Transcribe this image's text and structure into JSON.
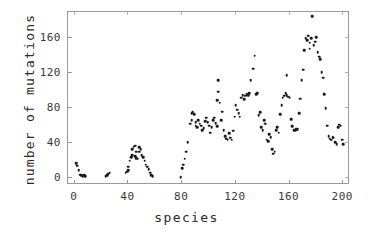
{
  "chart_data": {
    "type": "scatter",
    "title": "",
    "xlabel": "species",
    "ylabel": "number of mutations",
    "xlim": [
      -5,
      205
    ],
    "ylim": [
      -8,
      190
    ],
    "xticks": [
      0,
      40,
      80,
      120,
      160,
      200
    ],
    "yticks": [
      0,
      40,
      80,
      120,
      160
    ],
    "grid": false,
    "legend": null,
    "marker": "filled-circle",
    "marker_color": "#1a1a1a",
    "points": [
      [
        1,
        17
      ],
      [
        2,
        14
      ],
      [
        3,
        9
      ],
      [
        4,
        4
      ],
      [
        5,
        3
      ],
      [
        6,
        2
      ],
      [
        7,
        3
      ],
      [
        8,
        2
      ],
      [
        23,
        2
      ],
      [
        24,
        3
      ],
      [
        25,
        5
      ],
      [
        26,
        6
      ],
      [
        38,
        6
      ],
      [
        39,
        7
      ],
      [
        40,
        9
      ],
      [
        40,
        13
      ],
      [
        41,
        20
      ],
      [
        42,
        24
      ],
      [
        43,
        26
      ],
      [
        43,
        33
      ],
      [
        44,
        36
      ],
      [
        45,
        37
      ],
      [
        45,
        25
      ],
      [
        46,
        23
      ],
      [
        46,
        30
      ],
      [
        47,
        22
      ],
      [
        48,
        30
      ],
      [
        48,
        35
      ],
      [
        49,
        33
      ],
      [
        50,
        26
      ],
      [
        51,
        24
      ],
      [
        52,
        20
      ],
      [
        53,
        15
      ],
      [
        54,
        13
      ],
      [
        55,
        10
      ],
      [
        56,
        6
      ],
      [
        57,
        3
      ],
      [
        58,
        2
      ],
      [
        79,
        1
      ],
      [
        80,
        11
      ],
      [
        81,
        15
      ],
      [
        82,
        22
      ],
      [
        83,
        30
      ],
      [
        84,
        41
      ],
      [
        86,
        62
      ],
      [
        87,
        66
      ],
      [
        87,
        74
      ],
      [
        88,
        75
      ],
      [
        89,
        73
      ],
      [
        90,
        64
      ],
      [
        90,
        60
      ],
      [
        91,
        58
      ],
      [
        92,
        66
      ],
      [
        93,
        62
      ],
      [
        94,
        60
      ],
      [
        95,
        55
      ],
      [
        96,
        57
      ],
      [
        97,
        65
      ],
      [
        98,
        69
      ],
      [
        99,
        64
      ],
      [
        100,
        60
      ],
      [
        101,
        52
      ],
      [
        102,
        58
      ],
      [
        103,
        66
      ],
      [
        104,
        69
      ],
      [
        105,
        63
      ],
      [
        106,
        59
      ],
      [
        106,
        89
      ],
      [
        107,
        112
      ],
      [
        107,
        99
      ],
      [
        108,
        86
      ],
      [
        109,
        66
      ],
      [
        110,
        76
      ],
      [
        111,
        55
      ],
      [
        112,
        48
      ],
      [
        113,
        45
      ],
      [
        114,
        44
      ],
      [
        115,
        51
      ],
      [
        116,
        46
      ],
      [
        117,
        44
      ],
      [
        118,
        54
      ],
      [
        119,
        70
      ],
      [
        120,
        83
      ],
      [
        121,
        78
      ],
      [
        122,
        74
      ],
      [
        123,
        70
      ],
      [
        124,
        92
      ],
      [
        125,
        95
      ],
      [
        126,
        90
      ],
      [
        127,
        94
      ],
      [
        128,
        96
      ],
      [
        129,
        95
      ],
      [
        130,
        97
      ],
      [
        131,
        112
      ],
      [
        133,
        125
      ],
      [
        134,
        140
      ],
      [
        135,
        96
      ],
      [
        136,
        97
      ],
      [
        137,
        72
      ],
      [
        138,
        75
      ],
      [
        139,
        58
      ],
      [
        140,
        55
      ],
      [
        141,
        66
      ],
      [
        142,
        62
      ],
      [
        143,
        44
      ],
      [
        144,
        42
      ],
      [
        145,
        50
      ],
      [
        146,
        47
      ],
      [
        147,
        33
      ],
      [
        148,
        28
      ],
      [
        149,
        30
      ],
      [
        150,
        55
      ],
      [
        151,
        58
      ],
      [
        152,
        52
      ],
      [
        153,
        73
      ],
      [
        154,
        83
      ],
      [
        155,
        92
      ],
      [
        156,
        94
      ],
      [
        157,
        97
      ],
      [
        158,
        118
      ],
      [
        158,
        95
      ],
      [
        159,
        93
      ],
      [
        160,
        92
      ],
      [
        161,
        67
      ],
      [
        162,
        59
      ],
      [
        163,
        55
      ],
      [
        164,
        55
      ],
      [
        165,
        56
      ],
      [
        166,
        56
      ],
      [
        167,
        74
      ],
      [
        168,
        91
      ],
      [
        169,
        112
      ],
      [
        170,
        124
      ],
      [
        171,
        146
      ],
      [
        172,
        160
      ],
      [
        173,
        158
      ],
      [
        174,
        163
      ],
      [
        175,
        155
      ],
      [
        175,
        148
      ],
      [
        176,
        160
      ],
      [
        177,
        185
      ],
      [
        178,
        152
      ],
      [
        179,
        156
      ],
      [
        180,
        161
      ],
      [
        181,
        144
      ],
      [
        182,
        139
      ],
      [
        183,
        136
      ],
      [
        184,
        121
      ],
      [
        185,
        115
      ],
      [
        186,
        96
      ],
      [
        187,
        80
      ],
      [
        188,
        60
      ],
      [
        189,
        48
      ],
      [
        190,
        45
      ],
      [
        191,
        44
      ],
      [
        192,
        47
      ],
      [
        193,
        46
      ],
      [
        194,
        41
      ],
      [
        195,
        39
      ],
      [
        196,
        58
      ],
      [
        197,
        61
      ],
      [
        198,
        60
      ],
      [
        199,
        44
      ],
      [
        200,
        39
      ]
    ]
  },
  "axes": {
    "x_tick_labels": [
      "0",
      "40",
      "80",
      "120",
      "160",
      "200"
    ],
    "y_tick_labels": [
      "0",
      "40",
      "80",
      "120",
      "160"
    ],
    "x_title": "species",
    "y_title": "number of mutations"
  }
}
